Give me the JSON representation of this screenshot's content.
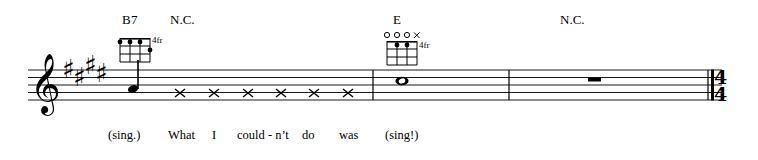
{
  "document": {
    "type": "music-notation-excerpt",
    "clef": "treble",
    "key_signature": {
      "accidental": "sharp",
      "count": 4,
      "key": "E major"
    },
    "time_signature": {
      "numerator": "4",
      "denominator": "4",
      "position": "end-of-system"
    },
    "ink_color": "#000000",
    "paper_color": "#ffffff"
  },
  "chords": [
    {
      "id": "chord-b7",
      "name": "B7",
      "fret_label": "4fr",
      "x": 122,
      "y": 16
    },
    {
      "id": "chord-nc-1",
      "name": "N.C.",
      "fret_label": "",
      "x": 170,
      "y": 16
    },
    {
      "id": "chord-e",
      "name": "E",
      "fret_label": "4fr",
      "x": 393,
      "y": 16
    },
    {
      "id": "chord-nc-2",
      "name": "N.C.",
      "fret_label": "",
      "x": 560,
      "y": 16
    }
  ],
  "chord_diagrams": [
    {
      "id": "diagram-b7",
      "for_chord": "B7",
      "fret_label": "4fr",
      "strings": 4,
      "frets": 3,
      "dots": [
        {
          "string": 1,
          "fret": 1
        },
        {
          "string": 2,
          "fret": 1
        },
        {
          "string": 3,
          "fret": 1
        },
        {
          "string": 4,
          "fret": 2
        }
      ],
      "open_strings": [],
      "muted_strings": []
    },
    {
      "id": "diagram-e",
      "for_chord": "E",
      "fret_label": "4fr",
      "strings": 4,
      "frets": 3,
      "dots": [
        {
          "string": 2,
          "fret": 1
        },
        {
          "string": 3,
          "fret": 1
        }
      ],
      "open_strings": [
        1,
        2,
        3
      ],
      "muted_strings": [
        4
      ]
    }
  ],
  "measures": [
    {
      "id": "measure-1",
      "content": "pickup-note-plus-rhythm-slashes"
    },
    {
      "id": "measure-2",
      "content": "whole-note"
    },
    {
      "id": "measure-3",
      "content": "whole-rest"
    }
  ],
  "notes": [
    {
      "id": "note-pickup",
      "type": "quarter",
      "stem": "up",
      "x": 133
    },
    {
      "id": "note-whole",
      "type": "whole",
      "x": 402
    }
  ],
  "rhythm_slashes": [
    {
      "id": "slash-1",
      "x": 180
    },
    {
      "id": "slash-2",
      "x": 214
    },
    {
      "id": "slash-3",
      "x": 248
    },
    {
      "id": "slash-4",
      "x": 281
    },
    {
      "id": "slash-5",
      "x": 314
    },
    {
      "id": "slash-6",
      "x": 348
    }
  ],
  "rests": [
    {
      "id": "whole-rest-1",
      "type": "whole",
      "x": 594
    }
  ],
  "barlines": [
    {
      "id": "barline-1",
      "x": 373,
      "type": "single"
    },
    {
      "id": "barline-2",
      "x": 509,
      "type": "single"
    },
    {
      "id": "barline-3",
      "x": 713,
      "type": "final"
    }
  ],
  "lyrics": [
    {
      "id": "lyric-sing-paren",
      "text": "(sing.)",
      "x": 108
    },
    {
      "id": "lyric-what",
      "text": "What",
      "x": 168
    },
    {
      "id": "lyric-i",
      "text": "I",
      "x": 212
    },
    {
      "id": "lyric-couldnt",
      "text": "could - n’t",
      "x": 237
    },
    {
      "id": "lyric-do",
      "text": "do",
      "x": 302
    },
    {
      "id": "lyric-was",
      "text": "was",
      "x": 339
    },
    {
      "id": "lyric-sing-excl",
      "text": "(sing!)",
      "x": 385
    }
  ],
  "staff": {
    "left": 28,
    "right": 722,
    "top": 70,
    "line_spacing": 7.5,
    "lines": 5
  }
}
